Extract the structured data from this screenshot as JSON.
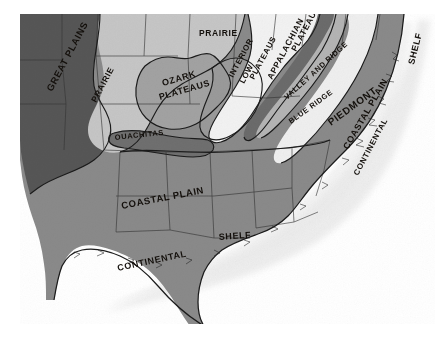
{
  "map": {
    "title": "Physiographic Provinces of the Central and Southeastern United States",
    "type": "physiographic-province-map",
    "style": "grayscale halftone print",
    "background_color": "#ffffff",
    "frame": {
      "x": 20,
      "y": 14,
      "width": 415,
      "height": 310
    },
    "palette": {
      "great_plains": "#565656",
      "prairie": "#c6c6c6",
      "ozark_plateaus": "#a2a2a2",
      "ouachitas": "#6f6f6f",
      "interior_low_plateaus": "#9a9a9a",
      "appalachian_plateaus": "#f2f2f2",
      "valley_and_ridge": "#6b6b6b",
      "blue_ridge": "#b4b4b4",
      "piedmont": "#efefef",
      "coastal_plain": "#8a8a8a",
      "continental_shelf": "#ffffff",
      "ocean": "#ffffff",
      "outline": "#1b1b1b",
      "state_line": "#2d2d2d",
      "label_text": "#14100c"
    },
    "labels": [
      {
        "id": "great-plains",
        "text": "GREAT PLAINS",
        "x": 52,
        "y": 92,
        "rotate": -62,
        "size": 9.5,
        "tone": "dark"
      },
      {
        "id": "prairie-west",
        "text": "PRAIRIE",
        "x": 96,
        "y": 103,
        "rotate": -62,
        "size": 8.5,
        "tone": "dark"
      },
      {
        "id": "prairie-north",
        "text": "PRAIRIE",
        "x": 199,
        "y": 36,
        "rotate": 0,
        "size": 8.5,
        "tone": "dark"
      },
      {
        "id": "ozark-plateaus",
        "text": "OZARK",
        "x": 163,
        "y": 86,
        "rotate": -16,
        "size": 9,
        "tone": "dark"
      },
      {
        "id": "ozark-plateaus-2",
        "text": "PLATEAUS",
        "x": 160,
        "y": 100,
        "rotate": -16,
        "size": 9,
        "tone": "dark"
      },
      {
        "id": "ouachitas",
        "text": "OUACHITAS",
        "x": 115,
        "y": 140,
        "rotate": -6,
        "size": 7.5,
        "tone": "dark"
      },
      {
        "id": "interior-low-plateaus",
        "text": "INTERIOR",
        "x": 233,
        "y": 78,
        "rotate": -62,
        "size": 8,
        "tone": "dark"
      },
      {
        "id": "interior-low-plateaus-2",
        "text": "LOW",
        "x": 244,
        "y": 84,
        "rotate": -62,
        "size": 8,
        "tone": "dark"
      },
      {
        "id": "interior-low-plateaus-3",
        "text": "PLATEAUS",
        "x": 254,
        "y": 80,
        "rotate": -62,
        "size": 8,
        "tone": "dark"
      },
      {
        "id": "appalachian-plateaus",
        "text": "APPALACHIAN",
        "x": 272,
        "y": 80,
        "rotate": -62,
        "size": 8.5,
        "tone": "dark"
      },
      {
        "id": "appalachian-plateaus-2",
        "text": "PLATEAUS",
        "x": 296,
        "y": 52,
        "rotate": -62,
        "size": 8.5,
        "tone": "dark"
      },
      {
        "id": "valley-and-ridge",
        "text": "VALLEY AND RIDGE",
        "x": 287,
        "y": 100,
        "rotate": -42,
        "size": 7.5,
        "tone": "dark"
      },
      {
        "id": "blue-ridge",
        "text": "BLUE RIDGE",
        "x": 291,
        "y": 124,
        "rotate": -36,
        "size": 7.5,
        "tone": "dark"
      },
      {
        "id": "piedmont",
        "text": "PIEDMONT",
        "x": 331,
        "y": 126,
        "rotate": -36,
        "size": 10,
        "tone": "dark"
      },
      {
        "id": "coastal-plain-east",
        "text": "COASTAL PLAIN",
        "x": 348,
        "y": 150,
        "rotate": -60,
        "size": 9,
        "tone": "dark"
      },
      {
        "id": "coastal-plain-south",
        "text": "COASTAL PLAIN",
        "x": 122,
        "y": 209,
        "rotate": -11,
        "size": 9.5,
        "tone": "dark"
      },
      {
        "id": "continental-shelf-east",
        "text": "CONTINENTAL",
        "x": 358,
        "y": 176,
        "rotate": -62,
        "size": 8,
        "tone": "dark"
      },
      {
        "id": "continental-shelf-east-2",
        "text": "SHELF",
        "x": 414,
        "y": 65,
        "rotate": -76,
        "size": 9,
        "tone": "dark"
      },
      {
        "id": "continental-shelf-gulf",
        "text": "CONTINENTAL",
        "x": 118,
        "y": 271,
        "rotate": -12,
        "size": 9,
        "tone": "dark"
      },
      {
        "id": "continental-shelf-gulf-2",
        "text": "SHELF",
        "x": 219,
        "y": 240,
        "rotate": -4,
        "size": 9,
        "tone": "dark"
      }
    ],
    "provinces": [
      {
        "id": "great-plains",
        "name": "Great Plains",
        "tone": "dark gray"
      },
      {
        "id": "prairie",
        "name": "Prairie",
        "tone": "light gray"
      },
      {
        "id": "ozark-plateaus",
        "name": "Ozark Plateaus",
        "tone": "medium gray"
      },
      {
        "id": "ouachitas",
        "name": "Ouachitas",
        "tone": "dark gray"
      },
      {
        "id": "interior-low-plateaus",
        "name": "Interior Low Plateaus",
        "tone": "medium gray"
      },
      {
        "id": "appalachian-plateaus",
        "name": "Appalachian Plateaus",
        "tone": "white"
      },
      {
        "id": "valley-and-ridge",
        "name": "Valley and Ridge",
        "tone": "dark gray"
      },
      {
        "id": "blue-ridge",
        "name": "Blue Ridge",
        "tone": "light gray"
      },
      {
        "id": "piedmont",
        "name": "Piedmont",
        "tone": "white"
      },
      {
        "id": "coastal-plain",
        "name": "Coastal Plain",
        "tone": "medium gray"
      },
      {
        "id": "continental-shelf",
        "name": "Continental Shelf",
        "tone": "white stipple"
      }
    ]
  }
}
